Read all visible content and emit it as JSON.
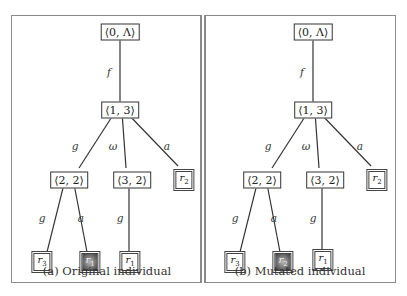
{
  "figures": [
    {
      "caption": "(a) Original individual",
      "root": "⟨0, Λ⟩",
      "level1": "⟨1, 3⟩",
      "node_22": "⟨2, 2⟩",
      "node_32": "⟨3, 2⟩",
      "edges": {
        "f": "f",
        "g1": "g",
        "omega": "ω",
        "a1": "a",
        "g2": "g",
        "a2": "a",
        "g3": "g"
      },
      "leaves": {
        "leaf_r2": {
          "base": "r",
          "sub": "2"
        },
        "leaf_r3": {
          "base": "r",
          "sub": "3"
        },
        "leaf_highlight": {
          "base": "r",
          "sub": "1"
        },
        "leaf_r1": {
          "base": "r",
          "sub": "1"
        }
      }
    },
    {
      "caption": "(b) Mutated individual",
      "root": "⟨0, Λ⟩",
      "level1": "⟨1, 3⟩",
      "node_22": "⟨2, 2⟩",
      "node_32": "⟨3, 2⟩",
      "edges": {
        "f": "f",
        "g1": "g",
        "omega": "ω",
        "a1": "a",
        "g2": "g",
        "a2": "a",
        "g3": "g"
      },
      "leaves": {
        "leaf_r2": {
          "base": "r",
          "sub": "2"
        },
        "leaf_r3": {
          "base": "r",
          "sub": "3"
        },
        "leaf_highlight": {
          "base": "r",
          "sub": "2"
        },
        "leaf_r1": {
          "base": "r",
          "sub": "1"
        }
      }
    }
  ],
  "colors": {
    "border": "#8a8a8a",
    "line": "#333333",
    "highlight": "#3a3a3a"
  }
}
